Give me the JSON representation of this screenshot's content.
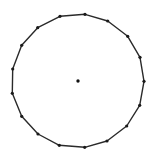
{
  "diagram": {
    "colors": {
      "background": "#ffffff",
      "stroke": "#2a2a2a",
      "vertex": "#1a1a1a",
      "center": "#111111"
    },
    "stroke_width": 1.4,
    "vertex_radius": 1.6,
    "center_radius": 1.7,
    "center": {
      "x": 78,
      "y": 81
    },
    "vertices": [
      {
        "x": 85,
        "y": 14.3
      },
      {
        "x": 107.7,
        "y": 21
      },
      {
        "x": 127.7,
        "y": 36.3
      },
      {
        "x": 140,
        "y": 57.3
      },
      {
        "x": 144,
        "y": 81.3
      },
      {
        "x": 139.7,
        "y": 105.3
      },
      {
        "x": 126.7,
        "y": 126
      },
      {
        "x": 107,
        "y": 141
      },
      {
        "x": 84.7,
        "y": 147.3
      },
      {
        "x": 59.3,
        "y": 145.3
      },
      {
        "x": 38,
        "y": 134
      },
      {
        "x": 21.7,
        "y": 116.3
      },
      {
        "x": 12.3,
        "y": 93.3
      },
      {
        "x": 12.7,
        "y": 69
      },
      {
        "x": 21.7,
        "y": 45.3
      },
      {
        "x": 37.7,
        "y": 27.7
      },
      {
        "x": 60,
        "y": 16.3
      }
    ]
  }
}
